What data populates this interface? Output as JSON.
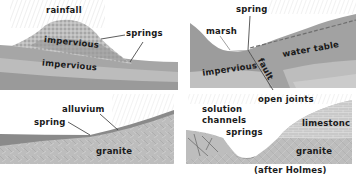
{
  "panels": [
    {
      "id": "panel-1",
      "labels": {
        "rainfall": "rainfall",
        "springs": "springs",
        "upper_impervious": "impervious",
        "lower_impervious": "impervious"
      }
    },
    {
      "id": "panel-2",
      "labels": {
        "spring": "spring",
        "marsh": "marsh",
        "water_table": "water table",
        "impervious": "impervious",
        "fault": "fault"
      }
    },
    {
      "id": "panel-3",
      "labels": {
        "alluvium": "alluvium",
        "spring": "spring",
        "granite": "granite"
      }
    },
    {
      "id": "panel-4",
      "labels": {
        "solution_channels_1": "solution",
        "solution_channels_2": "channels",
        "open_joints": "open joints",
        "springs": "springs",
        "limestone": "limestonc",
        "granite": "granite"
      }
    }
  ],
  "credit": "(after Holmes)",
  "colors": {
    "dark_stratum": "#8e8e8e",
    "mid_stratum": "#a9a9a9",
    "light_stratum": "#c8c8c8",
    "pale": "#dcdcdc",
    "line": "#333333"
  }
}
